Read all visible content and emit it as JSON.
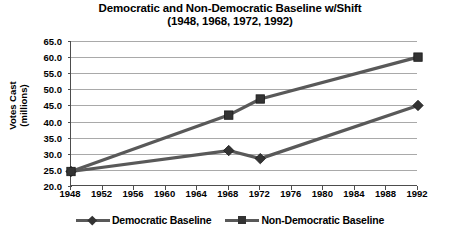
{
  "chart": {
    "title_line1": "Democratic and Non-Democratic Baseline w/Shift",
    "title_line2": "(1948, 1968, 1972, 1992)",
    "ytitle_line1": "Votes Cast",
    "ytitle_line2": "(millions)"
  },
  "legend": {
    "items": [
      {
        "label": "Democratic Baseline",
        "marker": "diamond-marker",
        "color": "#595959"
      },
      {
        "label": "Non-Democratic Baseline",
        "marker": "square-marker",
        "color": "#595959"
      }
    ]
  },
  "chart_data": {
    "type": "line",
    "title": "Democratic and Non-Democratic Baseline w/Shift (1948, 1968, 1972, 1992)",
    "xlabel": "",
    "ylabel": "Votes Cast (millions)",
    "x": [
      1948,
      1968,
      1972,
      1992
    ],
    "xticks": [
      1948,
      1952,
      1956,
      1960,
      1964,
      1968,
      1972,
      1976,
      1980,
      1984,
      1988,
      1992
    ],
    "xlim": [
      1948,
      1992
    ],
    "yticks": [
      20.0,
      25.0,
      30.0,
      35.0,
      40.0,
      45.0,
      50.0,
      55.0,
      60.0,
      65.0
    ],
    "ylim": [
      20.0,
      65.0
    ],
    "grid": "horizontal",
    "legend_position": "bottom",
    "series": [
      {
        "name": "Democratic Baseline",
        "marker": "diamond",
        "color": "#595959",
        "values": [
          24.5,
          31.0,
          28.5,
          45.0
        ]
      },
      {
        "name": "Non-Democratic Baseline",
        "marker": "square",
        "color": "#595959",
        "values": [
          24.5,
          42.0,
          47.0,
          60.0
        ]
      }
    ]
  }
}
